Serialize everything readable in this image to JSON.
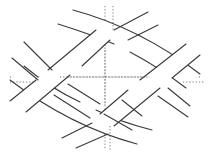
{
  "figure": {
    "title": "",
    "colors": {
      "background": "#ffffff",
      "band_edge": "#3a3a3a",
      "axis": "#555555"
    },
    "center": [
      105,
      77
    ],
    "axes": {
      "horizontal": {
        "y": 77,
        "x_from": 10,
        "x_to": 200,
        "style": "dotted"
      },
      "vertical": {
        "x": 105,
        "y_from": 8,
        "y_to": 148,
        "style": "dotted"
      }
    },
    "bands": [
      {
        "id": "band-top",
        "direction": "down-right",
        "edges": [
          [
            [
              73,
              10
            ],
            [
              130,
              30
            ],
            [
              195,
              78
            ]
          ],
          [
            [
              58,
              24
            ],
            [
              115,
              44
            ],
            [
              180,
              90
            ]
          ]
        ]
      },
      {
        "id": "band-right-upper",
        "direction": "up-right",
        "edges": [
          [
            [
              105,
              30
            ],
            [
              145,
              12
            ]
          ],
          [
            [
              130,
              45
            ],
            [
              160,
              25
            ]
          ]
        ]
      },
      {
        "id": "band-bottom",
        "direction": "up-right",
        "edges": [
          [
            [
              15,
              130
            ],
            [
              80,
              110
            ],
            [
              137,
              144
            ]
          ],
          [
            [
              30,
              144
            ],
            [
              95,
              124
            ],
            [
              152,
              130
            ]
          ]
        ]
      }
    ]
  }
}
